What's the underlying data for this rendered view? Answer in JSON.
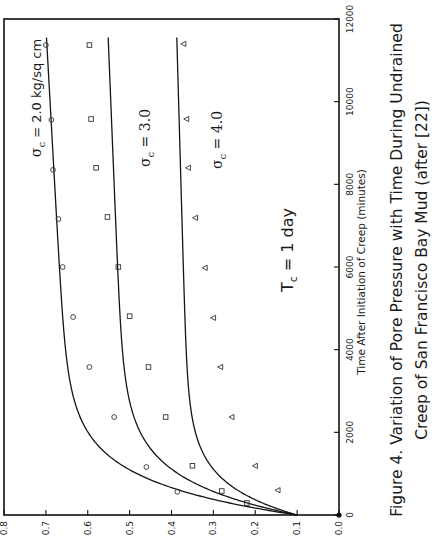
{
  "chart_data": {
    "type": "scatter",
    "orientation": "rotated 90 degrees counter-clockwise (value axis along bottom, time axis along right)",
    "caption_lines": [
      "Figure 4. Variation of Pore Pressure with Time During Undrained",
      "Creep of San Francisco Bay Mud (after [22])"
    ],
    "xlabel": "Time After Initiation of Creep (minutes)",
    "ylabel": "",
    "xlim": [
      0,
      12000
    ],
    "ylim": [
      0.0,
      0.8
    ],
    "x_ticks": [
      0,
      2000,
      4000,
      6000,
      8000,
      10000,
      12000
    ],
    "x_tick_labels": [
      "0",
      "2000",
      "4000",
      "6000",
      "8000",
      "10000",
      "12000"
    ],
    "y_ticks": [
      0.0,
      0.1,
      0.2,
      0.3,
      0.4,
      0.5,
      0.6,
      0.7,
      0.8
    ],
    "y_tick_labels": [
      "0.0",
      "0.1",
      "0.2",
      "0.3",
      "0.4",
      "0.5",
      "0.6",
      "0.7",
      "0.8"
    ],
    "grid": false,
    "legend": "none (series labeled inline)",
    "annotations": [
      {
        "text": "Tc = 1 day",
        "main": "T",
        "sub": "c",
        "rest": " = 1 day"
      }
    ],
    "series": [
      {
        "name": "σc = 2.0 kg/sq cm",
        "label_main": "σ",
        "label_sub": "c",
        "label_rest": " = 2.0 kg/sq cm",
        "marker": "circle",
        "x": [
          560,
          1160,
          2370,
          3580,
          4790,
          6000,
          7160,
          8350,
          9560,
          11370
        ],
        "values": [
          0.386,
          0.46,
          0.537,
          0.596,
          0.635,
          0.66,
          0.67,
          0.683,
          0.687,
          0.7
        ],
        "fit": {
          "v0": 0.1,
          "A": 0.535,
          "tau": 820,
          "slope": 5.5e-06
        }
      },
      {
        "name": "σc = 3.0",
        "label_main": "σ",
        "label_sub": "c",
        "label_rest": " = 3.0",
        "marker": "square",
        "x": [
          290,
          580,
          1190,
          2370,
          3580,
          4810,
          6000,
          7210,
          8400,
          9580,
          11370
        ],
        "values": [
          0.22,
          0.28,
          0.35,
          0.414,
          0.455,
          0.5,
          0.527,
          0.553,
          0.58,
          0.592,
          0.596
        ],
        "fit": {
          "v0": 0.1,
          "A": 0.405,
          "tau": 850,
          "slope": 4e-06
        }
      },
      {
        "name": "σc = 4.0",
        "label_main": "σ",
        "label_sub": "c",
        "label_rest": " = 4.0",
        "marker": "triangle",
        "x": [
          600,
          1190,
          2370,
          3580,
          4770,
          5980,
          7190,
          8400,
          9580,
          11400
        ],
        "values": [
          0.146,
          0.2,
          0.256,
          0.283,
          0.3,
          0.32,
          0.343,
          0.36,
          0.364,
          0.371
        ],
        "fit": {
          "v0": 0.1,
          "A": 0.255,
          "tau": 750,
          "slope": 2.8e-06
        }
      }
    ]
  },
  "layout": {
    "plot_left_px": 4,
    "plot_right_px": 339,
    "plot_top_px": 19,
    "plot_bottom_px": 515
  }
}
